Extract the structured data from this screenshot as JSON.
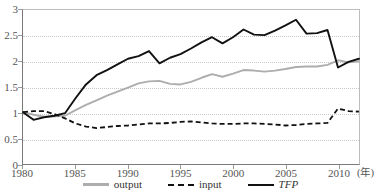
{
  "chart_data": {
    "type": "line",
    "title": "",
    "xlabel": "(年)",
    "ylabel": "",
    "xlim": [
      1980,
      2012
    ],
    "ylim": [
      0,
      3
    ],
    "grid": true,
    "legend_position": "bottom-center",
    "x": [
      1980,
      1981,
      1982,
      1983,
      1984,
      1985,
      1986,
      1987,
      1988,
      1989,
      1990,
      1991,
      1992,
      1993,
      1994,
      1995,
      1996,
      1997,
      1998,
      1999,
      2000,
      2001,
      2002,
      2003,
      2004,
      2005,
      2006,
      2007,
      2008,
      2009,
      2010,
      2011,
      2012
    ],
    "x_ticks": [
      1980,
      1985,
      1990,
      1995,
      2000,
      2005,
      2010
    ],
    "x_tick_labels": [
      "1980",
      "1985",
      "1990",
      "1995",
      "2000",
      "2005",
      "2010"
    ],
    "y_ticks": [
      0,
      0.5,
      1,
      1.5,
      2,
      2.5,
      3
    ],
    "y_tick_labels": [
      "0",
      "0.5",
      "1",
      "1.5",
      "2",
      "2.5",
      "3"
    ],
    "series": [
      {
        "name": "output",
        "style": "solid",
        "color": "#adadad",
        "values": [
          1.01,
          0.96,
          0.92,
          0.93,
          0.94,
          1.05,
          1.15,
          1.24,
          1.33,
          1.41,
          1.49,
          1.57,
          1.61,
          1.62,
          1.56,
          1.55,
          1.6,
          1.68,
          1.75,
          1.7,
          1.76,
          1.83,
          1.82,
          1.8,
          1.82,
          1.85,
          1.89,
          1.9,
          1.9,
          1.93,
          2.02,
          1.98,
          2.0
        ]
      },
      {
        "name": "input",
        "style": "dashed",
        "color": "#111111",
        "values": [
          1.01,
          1.03,
          1.03,
          0.97,
          0.89,
          0.79,
          0.73,
          0.7,
          0.72,
          0.74,
          0.75,
          0.77,
          0.79,
          0.79,
          0.8,
          0.82,
          0.83,
          0.81,
          0.79,
          0.78,
          0.78,
          0.79,
          0.79,
          0.78,
          0.77,
          0.75,
          0.76,
          0.78,
          0.79,
          0.8,
          1.08,
          1.03,
          1.02
        ]
      },
      {
        "name": "TFP",
        "style": "solid",
        "color": "#111111",
        "label_italic": true,
        "values": [
          1.01,
          0.86,
          0.91,
          0.94,
          0.99,
          1.28,
          1.55,
          1.73,
          1.83,
          1.94,
          2.05,
          2.1,
          2.2,
          1.96,
          2.07,
          2.14,
          2.25,
          2.37,
          2.47,
          2.35,
          2.47,
          2.62,
          2.52,
          2.51,
          2.6,
          2.7,
          2.81,
          2.54,
          2.55,
          2.61,
          1.88,
          1.99,
          2.05
        ]
      }
    ],
    "legend": [
      {
        "label": "output",
        "style": "solid-gray"
      },
      {
        "label": "input",
        "style": "dashed-black"
      },
      {
        "label": "TFP",
        "style": "solid-black"
      }
    ]
  }
}
